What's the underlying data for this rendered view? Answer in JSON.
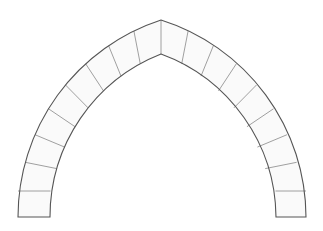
{
  "diagram": {
    "type": "pointed-arch",
    "colors": {
      "background": "#ffffff",
      "outline": "#555555",
      "joint": "#888888",
      "stone_fill": "#fafafa"
    },
    "geometry": {
      "apex_outer": [
        161,
        20
      ],
      "apex_inner": [
        161,
        54
      ],
      "left_base_outer_x": 18,
      "left_base_inner_x": 50,
      "right_base_inner_x": 276,
      "right_base_outer_x": 306,
      "base_y": 217,
      "springing_y": 217,
      "left_arc_center_x": 225.2,
      "right_arc_center_x": 96.8,
      "outer_radius": 207.2,
      "inner_radius": 175.2
    },
    "voussoirs_per_side": 8,
    "base_block_joint_y": 191,
    "labels": []
  }
}
